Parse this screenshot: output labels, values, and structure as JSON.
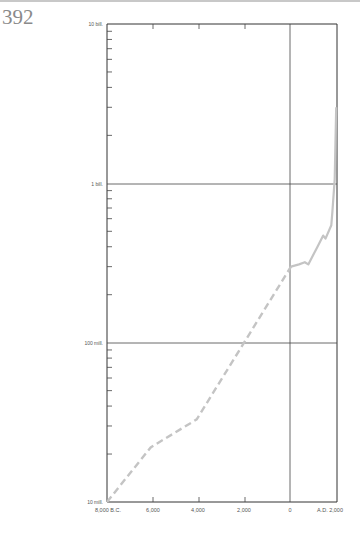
{
  "page": {
    "number": "392"
  },
  "chart_data": {
    "type": "line",
    "title": "",
    "xlabel": "",
    "ylabel": "",
    "y_scale": "log",
    "ylim": [
      10000000,
      10000000000
    ],
    "xlim": [
      -8000,
      2000
    ],
    "y_tick_labels": [
      "10 bill.",
      "1 bill.",
      "100 mill.",
      "10 mill."
    ],
    "x_tick_labels": [
      "8,000 B.C.",
      "6,000",
      "4,000",
      "2,000",
      "0",
      "A.D. 2,000"
    ],
    "grid": {
      "horizontal": [
        1000000000,
        100000000
      ],
      "vertical": [
        0
      ]
    },
    "series": [
      {
        "name": "World population (estimated, dashed)",
        "style": "dashed",
        "color": "#c4c4c4",
        "x": [
          -8000,
          -6100,
          -4100,
          0
        ],
        "y": [
          10000000,
          22000000,
          33000000,
          300000000
        ]
      },
      {
        "name": "World population (recorded, solid)",
        "style": "solid",
        "color": "#c4c4c4",
        "x": [
          0,
          350,
          600,
          750,
          1150,
          1400,
          1500,
          1750,
          1800,
          1900,
          1965
        ],
        "y": [
          300000000,
          310000000,
          320000000,
          310000000,
          400000000,
          470000000,
          450000000,
          545000000,
          665000000,
          1060000000,
          3000000000
        ]
      }
    ],
    "colors": {
      "axis": "#333333",
      "curve": "#c4c4c4"
    }
  }
}
